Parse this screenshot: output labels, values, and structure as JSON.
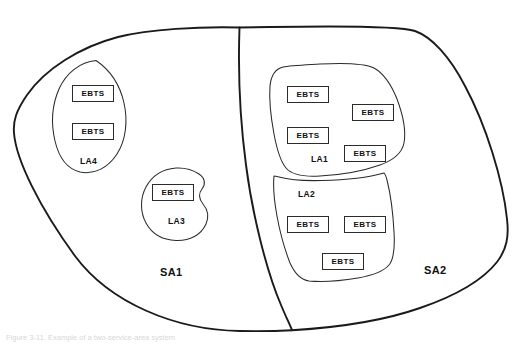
{
  "figure": {
    "caption": "Figure 3-11. Example of a two-service-area system",
    "background_color": "#ffffff",
    "outline_color": "#1a1a1a",
    "region_outline_color": "#2b2b2b",
    "box_border_color": "#2b2b2b",
    "text_color": "#111111"
  },
  "service_areas": [
    {
      "id": "sa1",
      "label": "SA1",
      "label_x": 160,
      "label_y": 267
    },
    {
      "id": "sa2",
      "label": "SA2",
      "label_x": 424,
      "label_y": 265
    }
  ],
  "local_areas": [
    {
      "id": "la4",
      "label": "LA4",
      "label_x": 80,
      "label_y": 157,
      "parent": "SA1"
    },
    {
      "id": "la3",
      "label": "LA3",
      "label_x": 168,
      "label_y": 217,
      "parent": "SA1"
    },
    {
      "id": "la1",
      "label": "LA1",
      "label_x": 311,
      "label_y": 155,
      "parent": "SA2"
    },
    {
      "id": "la2",
      "label": "LA2",
      "label_x": 298,
      "label_y": 190,
      "parent": "SA2"
    }
  ],
  "ebts_nodes": [
    {
      "id": "ebts-la4-1",
      "label": "EBTS",
      "x": 72,
      "y": 85,
      "w": 42,
      "h": 17,
      "area": "LA4"
    },
    {
      "id": "ebts-la4-2",
      "label": "EBTS",
      "x": 72,
      "y": 123,
      "w": 42,
      "h": 17,
      "area": "LA4"
    },
    {
      "id": "ebts-la3-1",
      "label": "EBTS",
      "x": 152,
      "y": 184,
      "w": 42,
      "h": 17,
      "area": "LA3"
    },
    {
      "id": "ebts-la1-1",
      "label": "EBTS",
      "x": 287,
      "y": 86,
      "w": 42,
      "h": 17,
      "area": "LA1"
    },
    {
      "id": "ebts-la1-2",
      "label": "EBTS",
      "x": 287,
      "y": 127,
      "w": 42,
      "h": 17,
      "area": "LA1"
    },
    {
      "id": "ebts-la1-3",
      "label": "EBTS",
      "x": 352,
      "y": 104,
      "w": 42,
      "h": 17,
      "area": "LA1"
    },
    {
      "id": "ebts-la1-4",
      "label": "EBTS",
      "x": 344,
      "y": 145,
      "w": 42,
      "h": 17,
      "area": "LA1"
    },
    {
      "id": "ebts-la2-1",
      "label": "EBTS",
      "x": 287,
      "y": 216,
      "w": 42,
      "h": 17,
      "area": "LA2"
    },
    {
      "id": "ebts-la2-2",
      "label": "EBTS",
      "x": 344,
      "y": 216,
      "w": 42,
      "h": 17,
      "area": "LA2"
    },
    {
      "id": "ebts-la2-3",
      "label": "EBTS",
      "x": 322,
      "y": 253,
      "w": 42,
      "h": 17,
      "area": "LA2"
    }
  ],
  "shapes": {
    "sa_outer_boundary": "M 239.5 27.5 C 200 26.5 150 29 118 37 C 80 47 45 69 27 95 C 16 111 13 121 14 133 C 16 160 40 208 75 256 C 110 303 175 330 240 331 C 262 331.4 278 331 292 330.2 C 330 328 380 322 420 308 C 455 296 482 281 497 262 C 507 249 509 236 507 219 C 503 180 486 125 465 86 C 450 57 432 37 415 31 C 400 26 330 26 270 27 Z",
    "sa_divider": "M 239.5 27.5 C 238 70 240 120 246 165 C 252 212 266 270 281 305 C 286 317 290 325 292 330.2",
    "la4_outline": "M 96 60.5 C 80 62 66 73 59 89 C 52 105 51 124 55 141 C 59 158 68 169 80 172 C 94 175 108 168 117 154 C 126 140 128 121 124 103 C 120 85 110 70 96 60.5 Z",
    "la3_outline": "M 176 168 C 163 169 152 176 146 187 C 140 198 140 212 146 223 C 152 234 163 240 176 240.5 C 190 241 201 235 206 224 C 209 217 208 210 203 204 C 199 199 198 194 202 189 C 206 184 205 178 199 174 C 193 170 185 167.5 176 168 Z",
    "la1_outline": "M 283 67 C 275 69 271 76 270 86 C 269 100 271 118 274 134 C 277 150 281 162 286 168 C 292 175 303 177 320 176 C 340 175 363 171 380 165 C 394 160 402 153 404 143 C 406 132 403 115 397 99 C 391 84 383 73 374 68 C 364 63 340 63 320 64 C 303 65 290 65.5 283 67 Z",
    "la2_outline": "M 274 176 C 273 186 274 200 277 216 C 280 233 285 250 290 263 C 295 274 301 280 309 281 C 320 282 340 281 358 278 C 374 275 384 271 389 265 C 394 259 395 248 394 232 C 393 212 390 192 387 180 C 386 176 385 174 384 173 C 370 177 345 180 322 180.5 C 303 181 288 179.5 279 177 C 277 176.5 275 176 274 176 Z"
  }
}
